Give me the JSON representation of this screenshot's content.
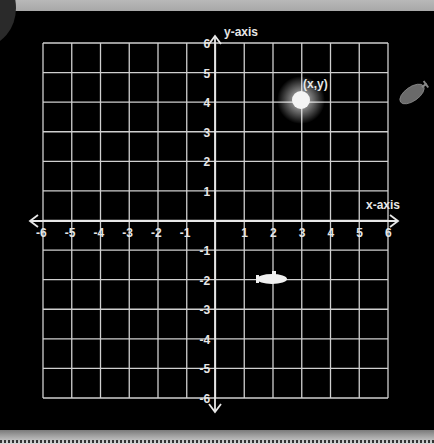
{
  "diagram": {
    "type": "coordinate-plane",
    "x_axis_label": "x-axis",
    "y_axis_label": "y-axis",
    "x_range": [
      -6,
      6
    ],
    "y_range": [
      -6,
      6
    ],
    "x_ticks": [
      "-6",
      "-5",
      "-4",
      "-3",
      "-2",
      "-1",
      "1",
      "2",
      "3",
      "4",
      "5",
      "6"
    ],
    "y_ticks": [
      "6",
      "5",
      "4",
      "3",
      "2",
      "1",
      "-1",
      "-2",
      "-3",
      "-4",
      "-5",
      "-6"
    ],
    "point": {
      "label": "(x,y)",
      "x": 3,
      "y": 4
    },
    "submarine": {
      "x": 2,
      "y": -2
    },
    "blimp_note": "grey airship outside grid to the right",
    "colors": {
      "background": "#000000",
      "grid": "#d0d0d0",
      "text": "#e6e6e6",
      "point": "#ffffff"
    }
  }
}
